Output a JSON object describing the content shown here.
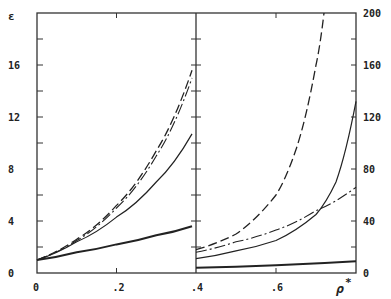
{
  "chart_data": {
    "type": "line",
    "title": "",
    "xlabel": "ρ*",
    "ylabel_left": "ε",
    "ylabel_right": "",
    "left_panel": {
      "xlim": [
        0,
        0.4
      ],
      "ylim": [
        0,
        20
      ],
      "x_ticks": [
        "0",
        ".2",
        ".4"
      ],
      "y_ticks": [
        "0",
        "4",
        "8",
        "12",
        "16"
      ],
      "series": [
        {
          "name": "long-dash",
          "style": "dashed",
          "x": [
            0,
            0.1,
            0.2,
            0.3,
            0.39
          ],
          "y": [
            1,
            2.6,
            5.2,
            9.4,
            15.6
          ]
        },
        {
          "name": "dash-dot",
          "style": "dashdot",
          "x": [
            0,
            0.1,
            0.2,
            0.3,
            0.39
          ],
          "y": [
            1,
            2.5,
            5.0,
            9.0,
            15.0
          ]
        },
        {
          "name": "solid-thin",
          "style": "solid",
          "x": [
            0,
            0.1,
            0.2,
            0.3,
            0.39
          ],
          "y": [
            1,
            2.4,
            4.3,
            7.0,
            10.7
          ]
        },
        {
          "name": "solid-thick",
          "style": "solid-bold",
          "x": [
            0,
            0.1,
            0.2,
            0.3,
            0.39
          ],
          "y": [
            1,
            1.6,
            2.2,
            2.9,
            3.6
          ]
        }
      ]
    },
    "right_panel": {
      "xlim": [
        0.4,
        0.8
      ],
      "ylim": [
        0,
        200
      ],
      "x_ticks": [
        ".6"
      ],
      "y_ticks": [
        "0",
        "40",
        "80",
        "120",
        "160",
        "200"
      ],
      "series": [
        {
          "name": "long-dash",
          "style": "dashed",
          "x": [
            0.4,
            0.5,
            0.6,
            0.65,
            0.7,
            0.72
          ],
          "y": [
            18,
            30,
            60,
            95,
            160,
            200
          ]
        },
        {
          "name": "dash-dot",
          "style": "dashdot",
          "x": [
            0.4,
            0.5,
            0.6,
            0.7,
            0.8
          ],
          "y": [
            16,
            24,
            33,
            48,
            66
          ]
        },
        {
          "name": "solid-thin",
          "style": "solid",
          "x": [
            0.4,
            0.5,
            0.6,
            0.7,
            0.75,
            0.8
          ],
          "y": [
            11,
            17,
            25,
            45,
            70,
            132
          ]
        },
        {
          "name": "solid-thick",
          "style": "solid-bold",
          "x": [
            0.4,
            0.6,
            0.8
          ],
          "y": [
            4,
            6,
            9
          ]
        }
      ]
    }
  }
}
